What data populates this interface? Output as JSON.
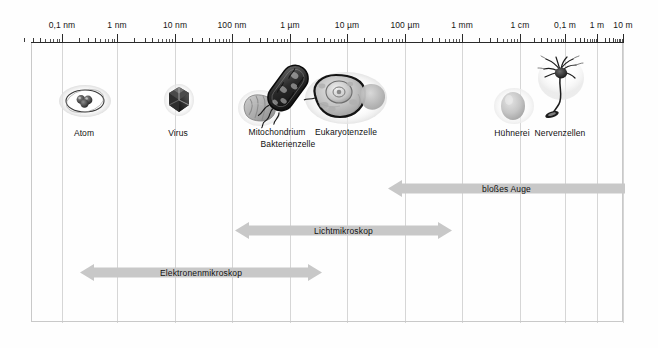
{
  "figure": {
    "scale_type": "logarithmic",
    "background": "#fefefe",
    "grid_color": "#d6d6d6",
    "arrow_fill": "#c8c8c8",
    "axis_color": "#2a2a2a"
  },
  "axis": {
    "ticks": [
      {
        "label": "0,1 nm",
        "x": 62
      },
      {
        "label": "1 nm",
        "x": 117
      },
      {
        "label": "10 nm",
        "x": 175
      },
      {
        "label": "100 nm",
        "x": 232
      },
      {
        "label": "1 µm",
        "x": 290
      },
      {
        "label": "10 µm",
        "x": 347
      },
      {
        "label": "100 µm",
        "x": 405
      },
      {
        "label": "1 mm",
        "x": 462
      },
      {
        "label": "1 cm",
        "x": 520
      },
      {
        "label": "0,1 m",
        "x": 565
      },
      {
        "label": "1 m",
        "x": 597
      },
      {
        "label": "10 m",
        "x": 623
      }
    ]
  },
  "specimens": [
    {
      "name": "Atom",
      "label": "Atom",
      "x": 84,
      "y": 128
    },
    {
      "name": "Virus",
      "label": "Virus",
      "x": 178,
      "y": 128
    },
    {
      "name": "Mitochondrium",
      "label": "Mitochondrium",
      "x": 277,
      "y": 127
    },
    {
      "name": "Bakterienzelle",
      "label": "Bakterienzelle",
      "x": 288,
      "y": 139
    },
    {
      "name": "Eukaryotenzelle",
      "label": "Eukaryotenzelle",
      "x": 346,
      "y": 127
    },
    {
      "name": "Huehnerei",
      "label": "Hühnerei",
      "x": 512,
      "y": 128
    },
    {
      "name": "Nervenzellen",
      "label": "Nervenzellen",
      "x": 560,
      "y": 128
    }
  ],
  "method_bars": [
    {
      "name": "blosses-auge",
      "label": "bloßes Auge",
      "left": 388,
      "right": 625,
      "top": 180,
      "arrow_left": true,
      "arrow_right": false
    },
    {
      "name": "lichtmikroskop",
      "label": "Lichtmikroskop",
      "left": 235,
      "right": 452,
      "top": 222,
      "arrow_left": true,
      "arrow_right": true
    },
    {
      "name": "elektronenmikroskop",
      "label": "Elektronenmikroskop",
      "left": 80,
      "right": 322,
      "top": 264,
      "arrow_left": true,
      "arrow_right": true
    }
  ]
}
